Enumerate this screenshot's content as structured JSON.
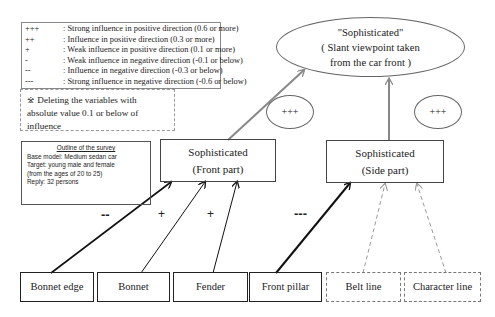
{
  "legend": {
    "rows": [
      {
        "symbol": "+++",
        "text": ": Strong influence in positive direction (0.6 or more)"
      },
      {
        "symbol": "++",
        "text": ": Influence in positive direction (0.3 or more)"
      },
      {
        "symbol": "+",
        "text": ": Weak influence in positive direction (0.1 or more)"
      },
      {
        "symbol": "-",
        "text": ": Weak influence in negative direction (-0.1 or below)"
      },
      {
        "symbol": "--",
        "text": ": Influence in negative direction (-0.3 or below)"
      },
      {
        "symbol": "---",
        "text": ": Strong influence in negative direction (-0.6 or below)"
      }
    ]
  },
  "note": {
    "line1": "※ Deleting the variables with",
    "line2": "absolute value 0.1 or below of influence"
  },
  "survey": {
    "title": "Outline of the survey",
    "lines": [
      "Base model: Medium sedan car",
      "Target: young male and female",
      "(from the ages of 20 to 25)",
      "Reply: 32 persons"
    ]
  },
  "top_node": {
    "line1": "\"Sophisticated\"",
    "line2": "( Slant viewpoint taken",
    "line3": "from the car front )"
  },
  "mid_nodes": [
    {
      "line1": "Sophisticated",
      "line2": "(Front part)",
      "influence": "+++"
    },
    {
      "line1": "Sophisticated",
      "line2": "(Side part)",
      "influence": "+++"
    }
  ],
  "leaves": [
    {
      "label": "Bonnet edge",
      "influence": "--",
      "target": "Front part"
    },
    {
      "label": "Bonnet",
      "influence": "+",
      "target": "Front part"
    },
    {
      "label": "Fender",
      "influence": "+",
      "target": "Front part"
    },
    {
      "label": "Front pillar",
      "influence": "---",
      "target": "Side part"
    },
    {
      "label": "Belt line",
      "influence": "",
      "target": "Side part"
    },
    {
      "label": "Character line",
      "influence": "",
      "target": "Side part"
    }
  ]
}
